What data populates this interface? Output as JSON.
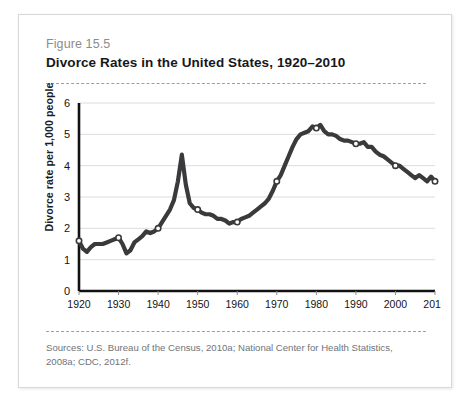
{
  "card": {
    "figure_label": "Figure 15.5",
    "title": "Divorce Rates in the United States, 1920–2010",
    "source": "Sources: U.S. Bureau of the Census, 2010a; National Center for Health Statistics, 2008a; CDC, 2012f."
  },
  "colors": {
    "line": "#3a3a3c",
    "grid": "#dcdcdc",
    "axis": "#111111",
    "title": "#17181a",
    "figure_label": "#8c8c8c",
    "source_text": "#6f7478",
    "card_border": "#d8d8d8",
    "rule": "#9aa0a4",
    "marker_fill": "#ffffff",
    "background": "#ffffff"
  },
  "chart_data": {
    "type": "line",
    "title": "Divorce Rates in the United States, 1920–2010",
    "xlabel": "",
    "ylabel": "Divorce rate per 1,000 people",
    "xlim": [
      1920,
      2010
    ],
    "ylim": [
      0,
      6
    ],
    "yticks": [
      0,
      1,
      2,
      3,
      4,
      5,
      6
    ],
    "xticks": [
      1920,
      1930,
      1940,
      1950,
      1960,
      1970,
      1980,
      1990,
      2000,
      2010
    ],
    "ytick_labels": [
      "0",
      "1",
      "2",
      "3",
      "4",
      "5",
      "6"
    ],
    "xtick_labels": [
      "1920",
      "1930",
      "1940",
      "1950",
      "1960",
      "1970",
      "1980",
      "1990",
      "2000",
      "2010"
    ],
    "grid": true,
    "grid_axis": "y",
    "legend": false,
    "marker": "open-circle",
    "marker_years": [
      1920,
      1930,
      1940,
      1950,
      1960,
      1970,
      1980,
      1990,
      2000,
      2010
    ],
    "series": [
      {
        "name": "Divorce rate per 1,000 people",
        "x": [
          1920,
          1921,
          1922,
          1923,
          1924,
          1925,
          1926,
          1927,
          1928,
          1929,
          1930,
          1931,
          1932,
          1933,
          1934,
          1935,
          1936,
          1937,
          1938,
          1939,
          1940,
          1941,
          1942,
          1943,
          1944,
          1945,
          1946,
          1947,
          1948,
          1949,
          1950,
          1951,
          1952,
          1953,
          1954,
          1955,
          1956,
          1957,
          1958,
          1959,
          1960,
          1961,
          1962,
          1963,
          1964,
          1965,
          1966,
          1967,
          1968,
          1969,
          1970,
          1971,
          1972,
          1973,
          1974,
          1975,
          1976,
          1977,
          1978,
          1979,
          1980,
          1981,
          1982,
          1983,
          1984,
          1985,
          1986,
          1987,
          1988,
          1989,
          1990,
          1991,
          1992,
          1993,
          1994,
          1995,
          1996,
          1997,
          1998,
          1999,
          2000,
          2001,
          2002,
          2003,
          2004,
          2005,
          2006,
          2007,
          2008,
          2009,
          2010
        ],
        "values": [
          1.6,
          1.35,
          1.25,
          1.4,
          1.5,
          1.5,
          1.5,
          1.55,
          1.6,
          1.65,
          1.7,
          1.5,
          1.2,
          1.3,
          1.55,
          1.65,
          1.75,
          1.9,
          1.85,
          1.9,
          2.0,
          2.2,
          2.4,
          2.6,
          2.9,
          3.5,
          4.35,
          3.4,
          2.8,
          2.65,
          2.6,
          2.5,
          2.45,
          2.45,
          2.4,
          2.3,
          2.3,
          2.25,
          2.15,
          2.2,
          2.2,
          2.3,
          2.35,
          2.4,
          2.5,
          2.6,
          2.7,
          2.8,
          2.95,
          3.2,
          3.5,
          3.7,
          4.0,
          4.3,
          4.6,
          4.85,
          5.0,
          5.05,
          5.1,
          5.25,
          5.2,
          5.3,
          5.1,
          5.0,
          5.0,
          4.95,
          4.85,
          4.8,
          4.8,
          4.75,
          4.7,
          4.7,
          4.75,
          4.6,
          4.6,
          4.45,
          4.35,
          4.3,
          4.2,
          4.1,
          4.0,
          4.0,
          3.9,
          3.8,
          3.7,
          3.6,
          3.7,
          3.6,
          3.5,
          3.65,
          3.5
        ]
      }
    ]
  }
}
